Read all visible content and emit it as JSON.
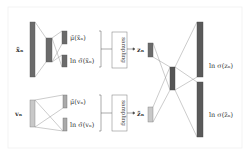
{
  "diagram": {
    "inputs": [
      {
        "id": "x_tilde",
        "label": "x̃ₙ"
      },
      {
        "id": "v",
        "label": "vₙ"
      }
    ],
    "encoder_top": {
      "outputs": [
        "μ̃(x̃ₙ)",
        "ln σ̃(x̃ₙ)"
      ]
    },
    "encoder_bottom": {
      "outputs": [
        "μ̄(vₙ)",
        "ln σ̄(vₙ)"
      ]
    },
    "sampling_top": "sampling",
    "sampling_bottom": "sampling",
    "latents": [
      "zₙ",
      "z̃ₙ"
    ],
    "decoder_outputs": [
      "ln σ(zₙ)",
      "ln σ(z̃ₙ)"
    ],
    "colors": {
      "dark": "#6b6b6b",
      "light": "#c8c8c8",
      "line": "#999999",
      "frame": "#eeeeee"
    }
  }
}
